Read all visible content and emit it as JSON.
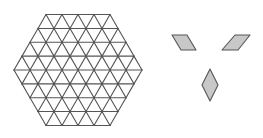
{
  "figure": {
    "hexagon": {
      "center": [
        78,
        70
      ],
      "side_units": 4,
      "unit_px": 16,
      "stroke": "#555555",
      "fill": "#ffffff"
    },
    "tiles": [
      {
        "name": "rhombus-right-leaning",
        "points": [
          [
            172,
            35
          ],
          [
            187,
            35
          ],
          [
            196,
            50
          ],
          [
            181,
            50
          ]
        ]
      },
      {
        "name": "rhombus-left-leaning",
        "points": [
          [
            235,
            35
          ],
          [
            250,
            35
          ],
          [
            238,
            50
          ],
          [
            222,
            50
          ]
        ]
      },
      {
        "name": "rhombus-vertical",
        "points": [
          [
            210,
            69
          ],
          [
            218,
            85
          ],
          [
            210,
            101
          ],
          [
            202,
            85
          ]
        ]
      }
    ],
    "tile_fill": "#c8c8c8",
    "tile_stroke": "#555555"
  }
}
